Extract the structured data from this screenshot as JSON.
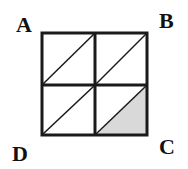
{
  "diagram": {
    "labels": {
      "A": "A",
      "B": "B",
      "C": "C",
      "D": "D"
    },
    "grid": {
      "rows": 2,
      "cols": 2
    },
    "shaded_region": "bottom-right cell, lower-right triangle",
    "colors": {
      "stroke": "#1a1a1a",
      "shade": "#d9d9d9",
      "background": "#ffffff"
    }
  }
}
